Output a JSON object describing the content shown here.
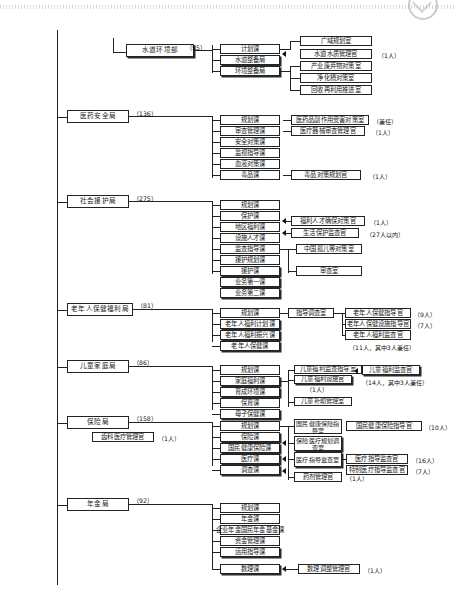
{
  "document": {
    "type": "organization-chart",
    "title": "厚生省机构图（局部）"
  },
  "sections": [
    {
      "id": "water-env",
      "bureau": "水道环境部",
      "staff_count": "（55）",
      "divisions": [
        "计划课",
        "水道整备局",
        "环境整备局"
      ],
      "offices": [
        {
          "label": "广域规划室",
          "note": ""
        },
        {
          "label": "水道水质管理官",
          "note": "（1人）"
        },
        {
          "label": "产业废弃物对策室",
          "note": ""
        },
        {
          "label": "净化槽对策室",
          "note": ""
        },
        {
          "label": "回收再利用推进室",
          "note": ""
        }
      ]
    },
    {
      "id": "pharma-safety",
      "bureau": "医药安全局",
      "staff_count": "（136）",
      "divisions": [
        "规划课",
        "审查管理课",
        "安全对策课",
        "监视指导课",
        "血液对策课",
        "毒品课"
      ],
      "offices": [
        {
          "label": "医药品副作用受害对策室",
          "note": "（兼任）"
        },
        {
          "label": "医疗器械审查管理官",
          "note": "（1人）"
        },
        {
          "label": "毒品对策规划官",
          "note": "（1人）"
        }
      ]
    },
    {
      "id": "social-aid",
      "bureau": "社会援护局",
      "staff_count": "（275）",
      "divisions": [
        "规划课",
        "保护课",
        "地区福利课",
        "设施人才课",
        "监查指导课",
        "援护规划课",
        "援护课",
        "业务第一课",
        "业务第二课"
      ],
      "offices": [
        {
          "label": "福利人才确保对策官",
          "note": "（1人）"
        },
        {
          "label": "生活保护监查官",
          "note": "（27人以内）"
        },
        {
          "label": "中国孤儿等对策室",
          "note": ""
        },
        {
          "label": "审查室",
          "note": ""
        }
      ]
    },
    {
      "id": "elderly-health",
      "bureau": "老年人保健福利局",
      "staff_count": "（81）",
      "divisions": [
        "规划课",
        "老年人福利计划课",
        "老年人福利振兴课",
        "老年人保健课"
      ],
      "mid_office": "指导调查室",
      "offices": [
        {
          "label": "老年人保健指导官",
          "note": "（9人）"
        },
        {
          "label": "老年人保健设施指导官",
          "note": "（7人）"
        },
        {
          "label": "老年人福利监查官",
          "note": ""
        }
      ],
      "footnote": "（11人，其中3人兼任）"
    },
    {
      "id": "child-family",
      "bureau": "儿童家庭局",
      "staff_count": "（86）",
      "divisions": [
        "规划课",
        "家庭福利课",
        "育成环境课",
        "保育课",
        "母子保健课"
      ],
      "mid_offices": [
        {
          "label": "儿童福利监查指导室",
          "note": ""
        },
        {
          "label": "儿童福利设施官",
          "note": "（1人）"
        },
        {
          "label": "儿童补助管理室",
          "note": ""
        }
      ],
      "offices": [
        {
          "label": "儿童福利监查官",
          "note": ""
        }
      ],
      "footnote": "（14人，其中3人兼任）"
    },
    {
      "id": "insurance",
      "bureau": "保险局",
      "staff_count": "（158）",
      "side_office": {
        "label": "齿科医疗管理官",
        "note": "（1人）"
      },
      "divisions": [
        "规划课",
        "保险课",
        "国民健康保险课",
        "医疗课",
        "调查课"
      ],
      "mid_offices": [
        {
          "label": "国民健康保险指导室",
          "note": ""
        },
        {
          "label": "保险医疗规划调查室",
          "note": ""
        },
        {
          "label": "医疗指导监查室",
          "note": ""
        },
        {
          "label": "药剂管理官",
          "note": "（1人）"
        }
      ],
      "offices": [
        {
          "label": "国民健康保险指导官",
          "note": "（10人）"
        },
        {
          "label": "医疗指导监查官",
          "note": "（16人）"
        },
        {
          "label": "特别医疗指导监查官",
          "note": "（7人）"
        }
      ]
    },
    {
      "id": "pension",
      "bureau": "年金局",
      "staff_count": "（92）",
      "divisions": [
        "规划课",
        "年金课",
        "企业年金国民年金基金课",
        "资金管理课",
        "运用指导课",
        "数理课"
      ],
      "offices": [
        {
          "label": "数理调整管理官",
          "note": "（1人）"
        }
      ]
    }
  ]
}
